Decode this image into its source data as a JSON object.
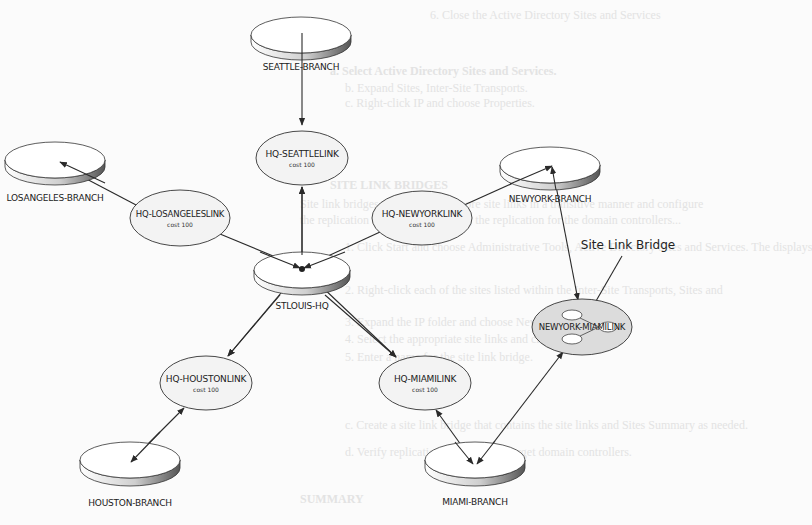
{
  "diagram": {
    "title_hint": "Active Directory site topology with site link bridge",
    "sites": [
      {
        "id": "seattle",
        "label": "SEATTLE-BRANCH",
        "cx": 301,
        "cy": 35
      },
      {
        "id": "losangeles",
        "label": "LOSANGELES-BRANCH",
        "cx": 55,
        "cy": 160
      },
      {
        "id": "newyork",
        "label": "NEWYORK-BRANCH",
        "cx": 550,
        "cy": 165
      },
      {
        "id": "stlouis",
        "label": "STLOUIS-HQ",
        "cx": 302,
        "cy": 270
      },
      {
        "id": "houston",
        "label": "HOUSTON-BRANCH",
        "cx": 130,
        "cy": 460
      },
      {
        "id": "miami",
        "label": "MIAMI-BRANCH",
        "cx": 475,
        "cy": 460
      }
    ],
    "site_links": [
      {
        "id": "seattlelink",
        "label": "HQ-SEATTLELINK",
        "cost": "cost 100",
        "cx": 302,
        "cy": 158
      },
      {
        "id": "losangeleslink",
        "label": "HQ-LOSANGELESLINK",
        "cost": "cost 100",
        "cx": 180,
        "cy": 218
      },
      {
        "id": "newyorklink",
        "label": "HQ-NEWYORKLINK",
        "cost": "cost 100",
        "cx": 422,
        "cy": 218
      },
      {
        "id": "houstonlink",
        "label": "HQ-HOUSTONLINK",
        "cost": "cost 100",
        "cx": 206,
        "cy": 383
      },
      {
        "id": "miamilink",
        "label": "HQ-MIAMILINK",
        "cost": "cost 100",
        "cx": 425,
        "cy": 383
      }
    ],
    "bridge": {
      "label": "NEWYORK-MIAMILINK",
      "cx": 582,
      "cy": 327
    },
    "annotation": {
      "label": "Site Link Bridge"
    },
    "colors": {
      "line": "#2a2a2a",
      "disk_top": "#ffffff",
      "disk_side": "#7a7a7a",
      "link_fill": "#f2f2f2",
      "bridge_fill": "#dcdcdc"
    }
  },
  "background_text": {
    "line1": "6.  Close the Active Directory Sites and Services",
    "line2": "a. Select Active Directory Sites and Services.",
    "line3": "b. Expand Sites, Inter-Site Transports.",
    "line4": "c. Right-click IP and choose Properties.",
    "line5": "SITE LINK BRIDGES",
    "line6": "Site link bridges connect two or more site links in a transitive manner and configure",
    "line7": "the replication topology. Otherwise, the replication for the domain controllers...",
    "line8": "1. Click Start and choose Administrative Tools, Active Directory Sites and Services. The displays",
    "line9": "2. Right-click each of the sites listed within the Inter-Site Transports, Sites and",
    "line10": "3. Expand the IP folder and choose New Site Link Bridge.",
    "line11": "4. Select the appropriate site links and click Add.",
    "line12": "5. Enter a name for the site link bridge.",
    "line13": "c. Create a site link bridge that contains the site links and Sites Summary as needed.",
    "line14": "d. Verify replication occurs to the target domain controllers.",
    "line15": "SUMMARY"
  }
}
